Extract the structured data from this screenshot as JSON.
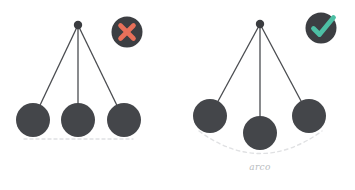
{
  "canvas": {
    "width": 355,
    "height": 190,
    "background": "#ffffff"
  },
  "palette": {
    "bob": "#44464a",
    "bob_stroke": "#3b3d41",
    "rod": "#4a4c50",
    "pivot": "#3a3c40",
    "badge_circle": "#3c3e42",
    "cross": "#e8705a",
    "check": "#4dbfa4",
    "dashed": "#e0e1e3",
    "label_text": "#b9bcc0"
  },
  "panels": [
    {
      "id": "incorrect",
      "name": "flat-path-pendulum",
      "badge": {
        "icon": "cross-icon",
        "meaning": "incorrect",
        "color": "#e8705a",
        "cx": 127,
        "cy": 32,
        "r": 16
      },
      "pivot": {
        "cx": 78,
        "cy": 25,
        "r": 4
      },
      "bobs": [
        {
          "cx": 33,
          "cy": 120,
          "r": 17,
          "position": "left"
        },
        {
          "cx": 78,
          "cy": 120,
          "r": 17,
          "position": "center"
        },
        {
          "cx": 124,
          "cy": 120,
          "r": 17,
          "position": "right"
        }
      ],
      "guide": {
        "type": "dashed-line",
        "x1": 24,
        "y1": 139,
        "x2": 133,
        "y2": 139
      },
      "caption": ""
    },
    {
      "id": "correct",
      "name": "arc-path-pendulum",
      "badge": {
        "icon": "check-icon",
        "meaning": "correct",
        "color": "#4dbfa4",
        "cx": 321,
        "cy": 28,
        "r": 16
      },
      "pivot": {
        "cx": 260,
        "cy": 24,
        "r": 4
      },
      "bobs": [
        {
          "cx": 210,
          "cy": 116,
          "r": 17,
          "position": "left"
        },
        {
          "cx": 260,
          "cy": 133,
          "r": 17,
          "position": "center"
        },
        {
          "cx": 309,
          "cy": 116,
          "r": 17,
          "position": "right"
        }
      ],
      "guide": {
        "type": "dashed-arc",
        "x1": 199,
        "y1": 131,
        "cx": 260,
        "cy": 176,
        "x2": 322,
        "y2": 131
      },
      "caption": "arco"
    }
  ],
  "labels": {
    "arc_caption": "arco"
  }
}
